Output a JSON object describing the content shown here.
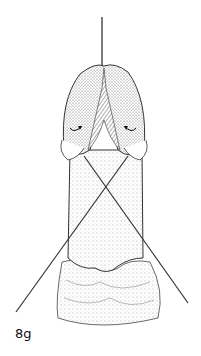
{
  "figure": {
    "label": "8g"
  }
}
